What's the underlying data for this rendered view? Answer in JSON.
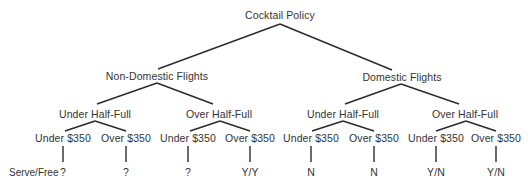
{
  "title": "Cocktail Policy",
  "row_label": "Serve/Free",
  "tree": {
    "root": {
      "label": "Cocktail Policy",
      "x": 280,
      "y": 15
    },
    "level1": [
      {
        "label": "Non-Domestic Flights",
        "x": 157,
        "y": 76
      },
      {
        "label": "Domestic Flights",
        "x": 402,
        "y": 77
      }
    ],
    "level2": [
      {
        "label": "Under Half-Full",
        "x": 95,
        "y": 114
      },
      {
        "label": "Over Half-Full",
        "x": 219,
        "y": 114
      },
      {
        "label": "Under Half-Full",
        "x": 343,
        "y": 114
      },
      {
        "label": "Over Half-Full",
        "x": 465,
        "y": 114
      }
    ],
    "level3": [
      {
        "label": "Under $350",
        "x": 63,
        "y": 138
      },
      {
        "label": "Over $350",
        "x": 126,
        "y": 138
      },
      {
        "label": "Under $350",
        "x": 188,
        "y": 138
      },
      {
        "label": "Over $350",
        "x": 250,
        "y": 138
      },
      {
        "label": "Under $350",
        "x": 311,
        "y": 138
      },
      {
        "label": "Over $350",
        "x": 374,
        "y": 138
      },
      {
        "label": "Under $350",
        "x": 436,
        "y": 138
      },
      {
        "label": "Over $350",
        "x": 496,
        "y": 138
      }
    ],
    "leaves": [
      {
        "value": "?",
        "x": 63,
        "y": 172
      },
      {
        "value": "?",
        "x": 126,
        "y": 172
      },
      {
        "value": "?",
        "x": 188,
        "y": 172
      },
      {
        "value": "Y/Y",
        "x": 250,
        "y": 172
      },
      {
        "value": "N",
        "x": 311,
        "y": 172
      },
      {
        "value": "N",
        "x": 374,
        "y": 172
      },
      {
        "value": "Y/N",
        "x": 436,
        "y": 172
      },
      {
        "value": "Y/N",
        "x": 496,
        "y": 172
      }
    ]
  }
}
